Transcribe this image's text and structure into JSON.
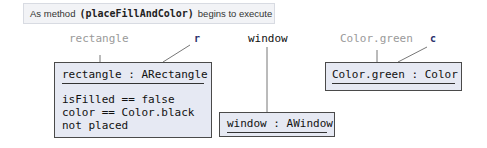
{
  "caption": {
    "prefix": "As method",
    "method": "(placeFillAndColor)",
    "suffix": "begins to execute"
  },
  "variables": {
    "rectangle": {
      "name": "rectangle",
      "ref": "r"
    },
    "window": {
      "name": "window"
    },
    "color": {
      "name": "Color.green",
      "ref": "c"
    }
  },
  "objects": {
    "rectangle": {
      "title": "rectangle : ARectangle",
      "fields": [
        "isFilled == false",
        "color == Color.black",
        "not placed"
      ]
    },
    "window": {
      "title": "window : AWindow"
    },
    "color": {
      "title": "Color.green : Color"
    }
  },
  "colors": {
    "box_fill": "#e6e9f3",
    "ref_label": "#2b2f6b",
    "var_gray": "#9a9a9a"
  }
}
